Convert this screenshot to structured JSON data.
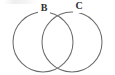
{
  "figure": {
    "background_color": "#ffffff",
    "stroke_color": "#6b6b6b",
    "label_color": "#2e2e2e",
    "width": 115,
    "height": 75
  },
  "diagram": {
    "type": "venn",
    "set_count": 2,
    "sets": [
      {
        "id": "set-b",
        "label": "B",
        "center_x": 43,
        "center_y": 42,
        "radius": 30,
        "label_x": 44,
        "label_y": 9
      },
      {
        "id": "set-c",
        "label": "C",
        "center_x": 72,
        "center_y": 42,
        "radius": 30,
        "label_x": 79,
        "label_y": 7
      }
    ],
    "intersection": {
      "upper_point_x": 57,
      "upper_point_y": 15,
      "lower_point_x": 57,
      "lower_point_y": 69,
      "shaded": false
    }
  }
}
